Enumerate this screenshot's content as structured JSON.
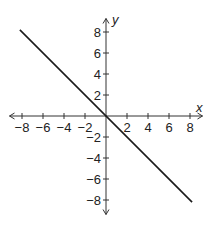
{
  "chart_data": {
    "type": "line",
    "title": "",
    "xlabel": "x",
    "ylabel": "y",
    "xlim": [
      -9,
      9
    ],
    "ylim": [
      -9,
      9
    ],
    "grid": false,
    "legend": null,
    "x_ticks": [
      -8,
      -6,
      -4,
      -2,
      2,
      4,
      6,
      8
    ],
    "y_ticks": [
      -8,
      -6,
      -4,
      -2,
      2,
      4,
      6,
      8
    ],
    "x_tick_labels": [
      "−8",
      "−6",
      "−4",
      "−2",
      "2",
      "4",
      "6",
      "8"
    ],
    "y_tick_labels": [
      "−8",
      "−6",
      "−4",
      "−2",
      "2",
      "4",
      "6",
      "8"
    ],
    "series": [
      {
        "name": "y = -x",
        "x": [
          -8.2,
          8.2
        ],
        "y": [
          8.2,
          -8.2
        ],
        "color": "#1a1a1a"
      }
    ],
    "axes_style": "cartesian-cross-with-arrows"
  },
  "colors": {
    "axis": "#333333",
    "line": "#1a1a1a",
    "background": "#ffffff"
  }
}
